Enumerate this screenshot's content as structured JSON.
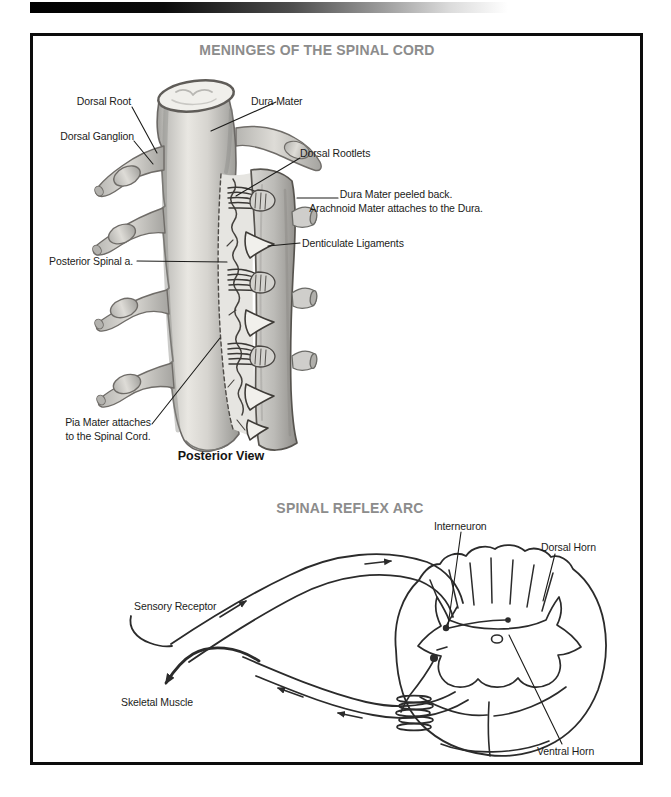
{
  "colors": {
    "title_gray": "#8c8c8c",
    "label_ink": "#1c1c1a",
    "sketch_ink": "#2b2b2b",
    "frame_black": "#0c0c0c"
  },
  "meninges_diagram": {
    "title": "MENINGES OF THE SPINAL CORD",
    "caption": "Posterior View",
    "labels": {
      "dorsal_root": "Dorsal Root",
      "dorsal_ganglion": "Dorsal Ganglion",
      "dura_mater": "Dura Mater",
      "dorsal_rootlets": "Dorsal Rootlets",
      "dura_peeled_line1": "Dura Mater peeled back.",
      "dura_peeled_line2": "Arachnoid Mater attaches to the Dura.",
      "denticulate_ligaments": "Denticulate Ligaments",
      "posterior_spinal_artery": "Posterior Spinal a.",
      "pia_mater_line1": "Pia Mater attaches",
      "pia_mater_line2": "to the Spinal Cord."
    }
  },
  "reflex_diagram": {
    "title": "SPINAL REFLEX ARC",
    "labels": {
      "interneuron": "Interneuron",
      "dorsal_horn": "Dorsal Horn",
      "sensory_receptor": "Sensory Receptor",
      "skeletal_muscle": "Skeletal Muscle",
      "ventral_horn": "Ventral Horn"
    }
  }
}
